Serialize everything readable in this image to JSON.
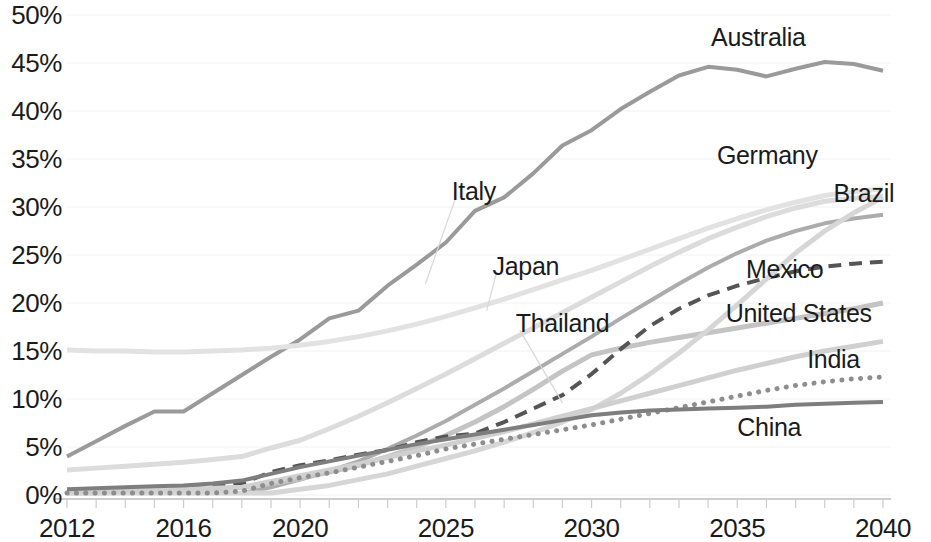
{
  "chart_data": {
    "type": "line",
    "title": "",
    "xlabel": "",
    "ylabel": "",
    "xlim": [
      2012,
      2040
    ],
    "ylim": [
      0,
      50
    ],
    "grid": "horizontal-faint",
    "legend": "inline-end-labels",
    "ytick_labels": [
      "50%",
      "45%",
      "40%",
      "35%",
      "30%",
      "25%",
      "20%",
      "15%",
      "10%",
      "5%",
      "0%"
    ],
    "ytick_values": [
      50,
      45,
      40,
      35,
      30,
      25,
      20,
      15,
      10,
      5,
      0
    ],
    "xtick_labels": [
      "2012",
      "2016",
      "2020",
      "2025",
      "2030",
      "2035",
      "2040"
    ],
    "xtick_values": [
      2012,
      2016,
      2020,
      2025,
      2030,
      2035,
      2040
    ],
    "x": [
      2012,
      2013,
      2014,
      2015,
      2016,
      2017,
      2018,
      2019,
      2020,
      2021,
      2022,
      2023,
      2024,
      2025,
      2026,
      2027,
      2028,
      2029,
      2030,
      2031,
      2032,
      2033,
      2034,
      2035,
      2036,
      2037,
      2038,
      2039,
      2040
    ],
    "series": [
      {
        "name": "Australia",
        "color": "#9a9a9a",
        "width": 4,
        "dash": "solid",
        "label_x": 2034.1,
        "label_y": 47.6,
        "leader": false,
        "values": [
          4.0,
          5.6,
          7.2,
          8.7,
          8.7,
          10.6,
          12.5,
          14.4,
          16.2,
          18.4,
          19.2,
          21.8,
          24.0,
          26.3,
          29.6,
          31.0,
          33.5,
          36.4,
          38.0,
          40.2,
          42.0,
          43.7,
          44.6,
          44.3,
          43.6,
          44.4,
          45.1,
          44.9,
          44.2
        ]
      },
      {
        "name": "Germany",
        "color": "#dcdcdc",
        "width": 5,
        "dash": "solid",
        "label_x": 2034.3,
        "label_y": 35.3,
        "leader": false,
        "values": [
          2.6,
          2.8,
          3.0,
          3.2,
          3.4,
          3.7,
          4.0,
          4.9,
          5.7,
          6.9,
          8.2,
          9.6,
          11.1,
          12.6,
          14.2,
          15.8,
          17.4,
          19.0,
          20.6,
          22.2,
          23.8,
          25.3,
          26.7,
          27.9,
          29.0,
          29.9,
          30.6,
          30.9,
          31.1
        ]
      },
      {
        "name": "Brazil",
        "color": "#acacac",
        "width": 4,
        "dash": "solid",
        "label_x": 2038.3,
        "label_y": 31.4,
        "leader": false,
        "values": [
          0.2,
          0.2,
          0.2,
          0.2,
          0.2,
          0.2,
          0.2,
          0.8,
          1.6,
          2.5,
          3.5,
          4.8,
          6.2,
          7.7,
          9.4,
          11.1,
          12.9,
          14.7,
          16.5,
          18.4,
          20.2,
          22.0,
          23.7,
          25.2,
          26.5,
          27.5,
          28.3,
          28.8,
          29.2
        ]
      },
      {
        "name": "Italy",
        "color": "#e2e2e2",
        "width": 5,
        "dash": "solid",
        "label_x": 2025.2,
        "label_y": 31.6,
        "leader": true,
        "leader_to_x": 2024.3,
        "leader_to_y": 22.0,
        "values": [
          15.1,
          15.0,
          15.0,
          14.9,
          14.9,
          15.0,
          15.1,
          15.3,
          15.6,
          16.0,
          16.5,
          17.1,
          17.8,
          18.6,
          19.5,
          20.4,
          21.4,
          22.4,
          23.4,
          24.5,
          25.6,
          26.7,
          27.8,
          28.8,
          29.7,
          30.5,
          31.2,
          31.6,
          31.9
        ]
      },
      {
        "name": "Japan",
        "color": "#c4c4c4",
        "width": 5,
        "dash": "solid",
        "label_x": 2026.6,
        "label_y": 23.8,
        "leader": true,
        "leader_to_x": 2026.4,
        "leader_to_y": 19.2,
        "values": [
          0.2,
          0.2,
          0.3,
          0.4,
          0.5,
          0.6,
          0.8,
          1.2,
          1.7,
          2.4,
          3.1,
          4.0,
          5.0,
          6.2,
          7.6,
          9.2,
          11.0,
          12.9,
          14.6,
          15.3,
          15.9,
          16.4,
          16.9,
          17.4,
          17.9,
          18.4,
          18.9,
          19.4,
          20.0
        ]
      },
      {
        "name": "Mexico",
        "color": "#555555",
        "width": 4,
        "dash": "dashed",
        "label_x": 2035.3,
        "label_y": 23.4,
        "leader": false,
        "values": [
          0.5,
          0.6,
          0.7,
          0.8,
          0.9,
          1.0,
          1.2,
          2.4,
          3.1,
          3.6,
          4.2,
          4.7,
          5.5,
          6.1,
          6.4,
          7.6,
          9.0,
          10.4,
          12.6,
          15.2,
          17.6,
          19.4,
          20.8,
          21.8,
          22.6,
          23.3,
          23.8,
          24.1,
          24.3
        ]
      },
      {
        "name": "Thailand",
        "color": "#d6d6d6",
        "width": 5,
        "dash": "solid",
        "label_x": 2027.4,
        "label_y": 17.8,
        "leader": true,
        "leader_to_x": 2029.0,
        "leader_to_y": 9.6,
        "values": [
          0.2,
          0.2,
          0.2,
          0.2,
          0.2,
          0.2,
          0.2,
          0.2,
          0.6,
          1.0,
          1.6,
          2.2,
          3.0,
          3.8,
          4.6,
          5.5,
          6.5,
          7.6,
          8.9,
          10.6,
          12.6,
          14.8,
          17.2,
          19.8,
          22.5,
          25.2,
          27.5,
          29.4,
          31.0
        ]
      },
      {
        "name": "United States",
        "color": "#d0d0d0",
        "width": 5,
        "dash": "solid",
        "label_x": 2034.6,
        "label_y": 18.9,
        "leader": false,
        "values": [
          0.4,
          0.4,
          0.5,
          0.5,
          0.6,
          0.7,
          0.8,
          1.4,
          2.0,
          2.6,
          3.2,
          3.9,
          4.6,
          5.2,
          5.9,
          6.6,
          7.4,
          8.2,
          9.0,
          9.8,
          10.6,
          11.4,
          12.2,
          13.0,
          13.7,
          14.4,
          15.0,
          15.5,
          16.0
        ]
      },
      {
        "name": "India",
        "color": "#8e8e8e",
        "width": 5,
        "dash": "dotted",
        "label_x": 2037.4,
        "label_y": 14.1,
        "leader": false,
        "values": [
          0.2,
          0.2,
          0.2,
          0.2,
          0.2,
          0.2,
          0.4,
          1.2,
          1.8,
          2.3,
          2.9,
          3.5,
          4.1,
          4.8,
          5.3,
          5.8,
          6.3,
          6.8,
          7.3,
          7.9,
          8.5,
          9.1,
          9.7,
          10.3,
          10.9,
          11.4,
          11.8,
          12.1,
          12.3
        ]
      },
      {
        "name": "China",
        "color": "#7e7e7e",
        "width": 4,
        "dash": "solid",
        "label_x": 2035.0,
        "label_y": 7.0,
        "leader": false,
        "values": [
          0.6,
          0.7,
          0.8,
          0.9,
          1.0,
          1.2,
          1.5,
          2.2,
          2.9,
          3.5,
          4.1,
          4.7,
          5.3,
          5.8,
          6.3,
          6.8,
          7.3,
          7.8,
          8.3,
          8.6,
          8.8,
          8.9,
          9.0,
          9.1,
          9.2,
          9.4,
          9.5,
          9.6,
          9.7
        ]
      }
    ]
  }
}
